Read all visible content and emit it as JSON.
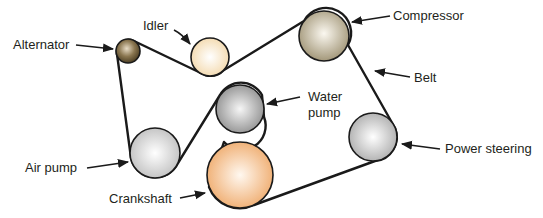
{
  "diagram": {
    "type": "serpentine-belt-layout",
    "colors": {
      "belt": "#1a1a1a",
      "alternator": "#7a6744",
      "idler": "#f6e3c2",
      "compressor": "#b8ad92",
      "water_pump": "#a8a8a8",
      "air_pump": "#d2d2d2",
      "crankshaft": "#f0b27a",
      "power_steering": "#c8c8c8"
    },
    "labels": {
      "alternator": "Alternator",
      "idler": "Idler",
      "compressor": "Compressor",
      "belt": "Belt",
      "water_pump_line1": "Water",
      "water_pump_line2": "pump",
      "air_pump": "Air pump",
      "crankshaft": "Crankshaft",
      "power_steering": "Power steering"
    },
    "pulleys": [
      {
        "id": "alternator",
        "cx": 128,
        "cy": 51,
        "r": 12
      },
      {
        "id": "idler",
        "cx": 210,
        "cy": 57,
        "r": 19
      },
      {
        "id": "compressor",
        "cx": 324,
        "cy": 36,
        "r": 25
      },
      {
        "id": "water_pump",
        "cx": 240,
        "cy": 109,
        "r": 24
      },
      {
        "id": "air_pump",
        "cx": 155,
        "cy": 153,
        "r": 25
      },
      {
        "id": "crankshaft",
        "cx": 240,
        "cy": 175,
        "r": 33
      },
      {
        "id": "power_steering",
        "cx": 373,
        "cy": 137,
        "r": 24
      }
    ]
  }
}
